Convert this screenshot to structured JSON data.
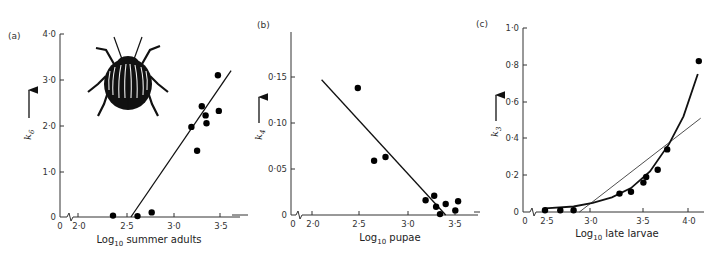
{
  "figure": {
    "panels": [
      {
        "label": "(a)",
        "ylabel": "k",
        "ylabel_sub": "6",
        "xlabel_pre": "Log",
        "xlabel_sub": "10",
        "xlabel_post": " summer adults"
      },
      {
        "label": "(b)",
        "ylabel": "k",
        "ylabel_sub": "4",
        "xlabel_pre": "Log",
        "xlabel_sub": "10",
        "xlabel_post": " pupae"
      },
      {
        "label": "(c)",
        "ylabel": "k",
        "ylabel_sub": "3",
        "xlabel_pre": "Log",
        "xlabel_sub": "10",
        "xlabel_post": " late larvae"
      }
    ],
    "illustration": "colorado-potato-beetle"
  },
  "chart_data": [
    {
      "type": "scatter",
      "panel": "(a)",
      "title": "",
      "xlabel": "Log10 summer adults",
      "ylabel": "k6",
      "x_ticks": [
        "0",
        "2·0",
        "2·5",
        "3·0",
        "3·5"
      ],
      "y_ticks": [
        "0",
        "1·0",
        "2·0",
        "3·0",
        "4·0"
      ],
      "xlim": [
        2.0,
        3.6
      ],
      "ylim": [
        0,
        4.0
      ],
      "axis_break": true,
      "grid": false,
      "points": [
        {
          "x": 2.37,
          "y": 0.03
        },
        {
          "x": 2.63,
          "y": 0.02
        },
        {
          "x": 2.78,
          "y": 0.1
        },
        {
          "x": 3.2,
          "y": 1.97
        },
        {
          "x": 3.26,
          "y": 1.45
        },
        {
          "x": 3.31,
          "y": 2.42
        },
        {
          "x": 3.35,
          "y": 2.22
        },
        {
          "x": 3.36,
          "y": 2.05
        },
        {
          "x": 3.48,
          "y": 3.1
        },
        {
          "x": 3.49,
          "y": 2.32
        }
      ],
      "fit_line": {
        "type": "linear",
        "x": [
          2.56,
          3.62
        ],
        "y": [
          0.0,
          3.2
        ]
      }
    },
    {
      "type": "scatter",
      "panel": "(b)",
      "title": "",
      "xlabel": "Log10 pupae",
      "ylabel": "k4",
      "x_ticks": [
        "0",
        "2·0",
        "2·5",
        "3·0",
        "3·5"
      ],
      "y_ticks": [
        "0",
        "0·05",
        "0·10",
        "0·15"
      ],
      "xlim": [
        2.0,
        3.6
      ],
      "ylim": [
        0,
        0.19
      ],
      "axis_break": true,
      "grid": false,
      "points": [
        {
          "x": 2.48,
          "y": 0.138
        },
        {
          "x": 2.65,
          "y": 0.059
        },
        {
          "x": 2.77,
          "y": 0.063
        },
        {
          "x": 3.19,
          "y": 0.016
        },
        {
          "x": 3.28,
          "y": 0.021
        },
        {
          "x": 3.3,
          "y": 0.009
        },
        {
          "x": 3.34,
          "y": 0.001
        },
        {
          "x": 3.4,
          "y": 0.012
        },
        {
          "x": 3.5,
          "y": 0.005
        },
        {
          "x": 3.53,
          "y": 0.015
        }
      ],
      "fit_line": {
        "type": "linear",
        "x": [
          2.1,
          3.4
        ],
        "y": [
          0.147,
          0.0
        ]
      }
    },
    {
      "type": "scatter",
      "panel": "(c)",
      "title": "",
      "xlabel": "Log10 late larvae",
      "ylabel": "k3",
      "x_ticks": [
        "0",
        "2·5",
        "3·0",
        "3·5",
        "4·0"
      ],
      "y_ticks": [
        "0",
        "0·2",
        "0·4",
        "0·6",
        "0·8",
        "1·0"
      ],
      "xlim": [
        2.5,
        4.2
      ],
      "ylim": [
        0,
        1.0
      ],
      "axis_break": true,
      "grid": false,
      "points": [
        {
          "x": 2.5,
          "y": 0.01
        },
        {
          "x": 2.66,
          "y": 0.01
        },
        {
          "x": 2.8,
          "y": 0.01
        },
        {
          "x": 3.28,
          "y": 0.1
        },
        {
          "x": 3.4,
          "y": 0.11
        },
        {
          "x": 3.53,
          "y": 0.16
        },
        {
          "x": 3.56,
          "y": 0.19
        },
        {
          "x": 3.68,
          "y": 0.23
        },
        {
          "x": 3.78,
          "y": 0.34
        },
        {
          "x": 4.11,
          "y": 0.82
        }
      ],
      "fit_line": {
        "type": "linear",
        "x": [
          2.86,
          4.13
        ],
        "y": [
          0.0,
          0.51
        ]
      },
      "fit_curve": {
        "type": "exponential",
        "x": [
          2.5,
          2.8,
          3.0,
          3.2,
          3.4,
          3.6,
          3.8,
          3.95,
          4.1
        ],
        "y": [
          0.02,
          0.03,
          0.05,
          0.08,
          0.13,
          0.22,
          0.37,
          0.52,
          0.75
        ]
      }
    }
  ]
}
